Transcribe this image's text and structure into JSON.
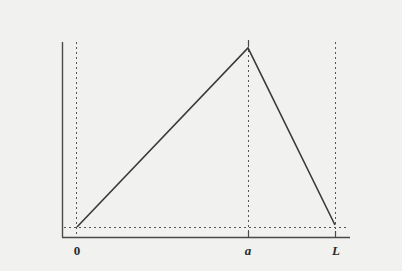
{
  "diagram": {
    "type": "triangular-function-plot",
    "colors": {
      "background": "#f1f1ef",
      "curve": "#3a3a3a",
      "axis": "#4a4a4a",
      "guide": "#555555"
    },
    "axes": {
      "x_ticks": [
        {
          "label": "0",
          "position": 0
        },
        {
          "label": "a",
          "position": "a"
        },
        {
          "label": "L",
          "position": "L"
        }
      ]
    },
    "curve": {
      "description": "piecewise linear tent function rising from 0 to peak at a, falling to L",
      "points": [
        {
          "x": "0",
          "y": "0"
        },
        {
          "x": "a",
          "y": "max"
        },
        {
          "x": "L",
          "y": "0"
        }
      ]
    },
    "guides": [
      "vertical dotted line at 0",
      "vertical dotted line at a",
      "vertical dotted line at L",
      "horizontal dotted baseline"
    ]
  }
}
